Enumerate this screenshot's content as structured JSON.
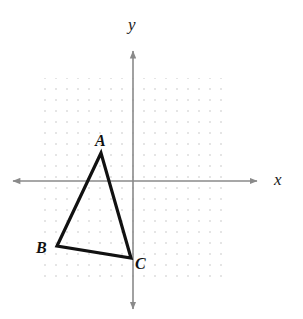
{
  "figure": {
    "background_color": "#ffffff",
    "width": 303,
    "height": 319
  },
  "axes": {
    "x_axis": {
      "label": "x",
      "label_position": {
        "x": 274,
        "y": 171
      },
      "line_y": 181,
      "start_x": 12,
      "end_x": 258,
      "color": "#8a8a8a",
      "arrow_both_ends": true
    },
    "y_axis": {
      "label": "y",
      "label_position": {
        "x": 128,
        "y": 16
      },
      "line_x": 133,
      "start_y": 50,
      "end_y": 310,
      "color": "#8a8a8a",
      "arrow_both_ends": true
    }
  },
  "grid": {
    "type": "dot-grid",
    "visible": true,
    "dot_color": "#d8d8d8",
    "dot_radius": 0.9,
    "spacing": 11,
    "left": 35,
    "top": 78,
    "right": 228,
    "bottom": 283,
    "columns": 18,
    "rows": 19
  },
  "chart_data": {
    "type": "scatter",
    "title": "",
    "xlabel": "x",
    "ylabel": "y",
    "grid": true,
    "legend": null,
    "shape": {
      "name": "triangle-ABC",
      "closed": true,
      "stroke_color": "#111111",
      "stroke_width": 3.2,
      "fill": "none",
      "vertices": [
        {
          "label": "A",
          "px": 101,
          "py": 153,
          "label_px": 95,
          "label_py": 133
        },
        {
          "label": "B",
          "px": 57,
          "py": 246,
          "label_px": 36,
          "label_py": 240
        },
        {
          "label": "C",
          "px": 131,
          "py": 258,
          "label_px": 135,
          "label_py": 256
        }
      ],
      "edges": [
        "AB",
        "BC",
        "CA"
      ]
    },
    "annotations": [
      "A",
      "B",
      "C"
    ]
  },
  "labels": {
    "axis_x": "x",
    "axis_y": "y",
    "vertex_a": "A",
    "vertex_b": "B",
    "vertex_c": "C"
  }
}
